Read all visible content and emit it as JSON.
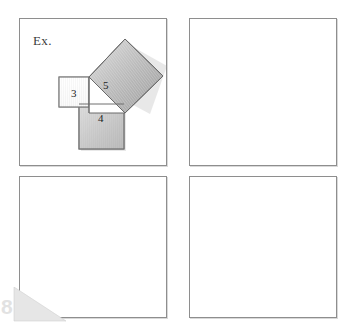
{
  "page": {
    "width": 354,
    "height": 335,
    "background": "#ffffff",
    "panel_border_color": "#8e8e8e"
  },
  "worksheet": {
    "example_label": "Ex.",
    "panels": [
      {
        "id": "top-left",
        "name": "panel-example",
        "empty": false
      },
      {
        "id": "top-right",
        "name": "panel-blank-1",
        "empty": true
      },
      {
        "id": "bottom-left",
        "name": "panel-blank-2",
        "empty": true
      },
      {
        "id": "bottom-right",
        "name": "panel-blank-3",
        "empty": true
      }
    ]
  },
  "figure": {
    "type": "pythagorean-theorem-diagram",
    "triangle": {
      "leg_a": "3",
      "leg_b": "4",
      "hypotenuse": "5"
    },
    "squares": [
      {
        "name": "square-leg-a",
        "label": "3",
        "fill": "#fbfbfb",
        "stroke": "#7c7c7c",
        "orientation": "axis-aligned"
      },
      {
        "name": "square-leg-b",
        "label": "4",
        "fill": "#b4b4b4",
        "stroke": "#6e6e6e",
        "orientation": "axis-aligned"
      },
      {
        "name": "square-hypotenuse",
        "label": "5",
        "fill": "#a8a8a8",
        "stroke": "#6a6a6a",
        "orientation": "tilted"
      }
    ],
    "labels": {
      "three": "3",
      "four": "4",
      "five": "5"
    }
  },
  "watermark": {
    "shape": "right-triangle",
    "color": "#e6e6e6",
    "digit": "8"
  }
}
